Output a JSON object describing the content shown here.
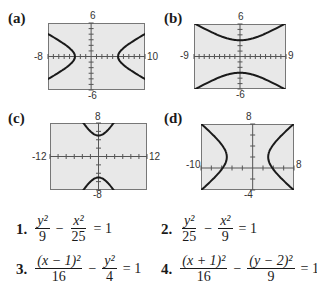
{
  "chart_data": [
    {
      "id": "a",
      "label": "(a)",
      "type": "line",
      "title": "",
      "xlim": [
        -8,
        10
      ],
      "ylim": [
        -6,
        6
      ],
      "tick_labels": {
        "top": "6",
        "bottom": "-6",
        "left": "-8",
        "right": "10"
      },
      "xtick_step": 1,
      "ytick_step": 1,
      "curve": "hyperbola opening left/right, centered (1, 0), a=4, b=2",
      "series": [
        {
          "name": "left branch",
          "equation": "(x-1)^2/16 - y^2/4 = 1",
          "vertex": [
            -3,
            0
          ]
        },
        {
          "name": "right branch",
          "equation": "(x-1)^2/16 - y^2/4 = 1",
          "vertex": [
            5,
            0
          ]
        }
      ]
    },
    {
      "id": "b",
      "label": "(b)",
      "type": "line",
      "xlim": [
        -9,
        9
      ],
      "ylim": [
        -6,
        6
      ],
      "tick_labels": {
        "top": "6",
        "bottom": "-6",
        "left": "-9",
        "right": "9"
      },
      "xtick_step": 1,
      "ytick_step": 1,
      "curve": "hyperbola opening up/down, centered (0,0), a=3, b=5",
      "series": [
        {
          "name": "upper branch",
          "equation": "y^2/9 - x^2/25 = 1",
          "vertex": [
            0,
            3
          ]
        },
        {
          "name": "lower branch",
          "equation": "y^2/9 - x^2/25 = 1",
          "vertex": [
            0,
            -3
          ]
        }
      ]
    },
    {
      "id": "c",
      "label": "(c)",
      "type": "line",
      "xlim": [
        -12,
        12
      ],
      "ylim": [
        -8,
        8
      ],
      "tick_labels": {
        "top": "8",
        "bottom": "-8",
        "left": "-12",
        "right": "12"
      },
      "xtick_step": 2,
      "ytick_step": 2,
      "curve": "hyperbola opening up/down, centered (0,0), a=5, b=3",
      "series": [
        {
          "name": "upper branch",
          "equation": "y^2/25 - x^2/9 = 1",
          "vertex": [
            0,
            5
          ]
        },
        {
          "name": "lower branch",
          "equation": "y^2/25 - x^2/9 = 1",
          "vertex": [
            0,
            -5
          ]
        }
      ]
    },
    {
      "id": "d",
      "label": "(d)",
      "type": "line",
      "xlim": [
        -10,
        8
      ],
      "ylim": [
        -4,
        8
      ],
      "tick_labels": {
        "top": "8",
        "bottom": "-4",
        "left": "-10",
        "right": "8"
      },
      "xtick_step": 2,
      "ytick_step": 2,
      "curve": "hyperbola opening left/right, centered (-1, 2), a=4, b=3",
      "series": [
        {
          "name": "left branch",
          "equation": "(x+1)^2/16 - (y-2)^2/9 = 1",
          "vertex": [
            -5,
            2
          ]
        },
        {
          "name": "right branch",
          "equation": "(x+1)^2/16 - (y-2)^2/9 = 1",
          "vertex": [
            3,
            2
          ]
        }
      ]
    }
  ],
  "equations": [
    {
      "number": "1.",
      "term1_num": "y²",
      "term1_den": "9",
      "op": "−",
      "term2_num": "x²",
      "term2_den": "25",
      "rhs": "= 1"
    },
    {
      "number": "2.",
      "term1_num": "y²",
      "term1_den": "25",
      "op": "−",
      "term2_num": "x²",
      "term2_den": "9",
      "rhs": "= 1"
    },
    {
      "number": "3.",
      "term1_num": "(x − 1)²",
      "term1_den": "16",
      "op": "−",
      "term2_num": "y²",
      "term2_den": "4",
      "rhs": "= 1"
    },
    {
      "number": "4.",
      "term1_num": "(x + 1)²",
      "term1_den": "16",
      "op": "−",
      "term2_num": "(y − 2)²",
      "term2_den": "9",
      "rhs": "= 1"
    }
  ],
  "colors": {
    "frame_bg": "#e8e8e8",
    "frame_border": "#777777",
    "curve": "#1a1a1a",
    "axis": "#555555"
  }
}
